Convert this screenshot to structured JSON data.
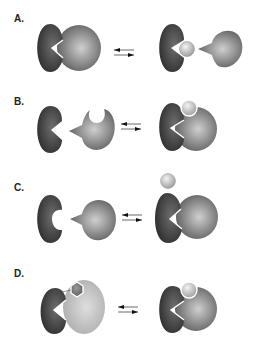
{
  "figure": {
    "panels": [
      {
        "label": "A.",
        "description": "Two subunits associate; ligand binding dissociates the complex"
      },
      {
        "label": "B.",
        "description": "Subunits associate with ligand bridging both"
      },
      {
        "label": "C.",
        "description": "Ligand binds to one subunit, enabling association"
      },
      {
        "label": "D.",
        "description": "Hexagonal ligand-bound conformation exchanges with round-ligand-bound complex"
      }
    ],
    "arrow_symbol": "equilibrium-arrows",
    "colors": {
      "dark_subunit": "#3a3a3a",
      "mid_subunit": "#7a7a7a",
      "light_subunit": "#c8c8c8",
      "ligand": "#d8d8d8",
      "background": "#ffffff"
    }
  }
}
